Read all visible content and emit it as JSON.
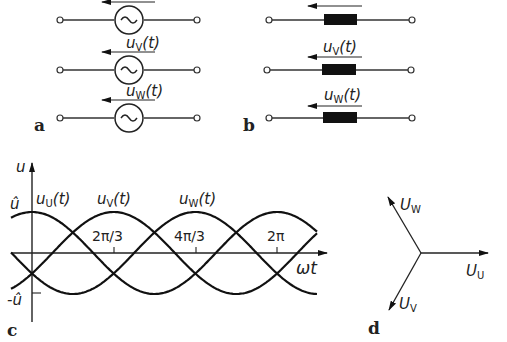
{
  "panels": {
    "a": {
      "label": "a",
      "title": "AC voltage sources"
    },
    "b": {
      "label": "b",
      "title": "Equivalent resistive loads"
    },
    "c": {
      "label": "c",
      "title": "Three-phase voltage waveforms"
    },
    "d": {
      "label": "d",
      "title": "Phasor diagram"
    }
  },
  "sources": [
    {
      "name": "u",
      "label": "u",
      "sub": "U",
      "arg": "(t)"
    },
    {
      "name": "v",
      "label": "u",
      "sub": "V",
      "arg": "(t)"
    },
    {
      "name": "w",
      "label": "u",
      "sub": "W",
      "arg": "(t)"
    }
  ],
  "waveform": {
    "y_axis_label": "u",
    "x_axis_label": "ωt",
    "peak_label": "û",
    "trough_label": "-û",
    "curve_labels": [
      {
        "label": "u",
        "sub": "U",
        "arg": "(t)"
      },
      {
        "label": "u",
        "sub": "V",
        "arg": "(t)"
      },
      {
        "label": "u",
        "sub": "W",
        "arg": "(t)"
      }
    ],
    "ticks": [
      "2π/3",
      "4π/3",
      "2π"
    ]
  },
  "phasors": [
    {
      "label": "U",
      "sub": "U",
      "angle_deg": 0
    },
    {
      "label": "U",
      "sub": "V",
      "angle_deg": -120
    },
    {
      "label": "U",
      "sub": "W",
      "angle_deg": 120
    }
  ],
  "colors": {
    "line": "#111111",
    "background": "#ffffff"
  }
}
